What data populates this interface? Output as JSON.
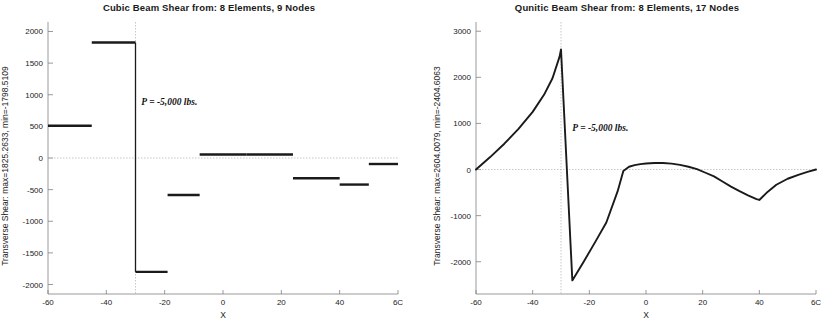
{
  "figure": {
    "background": "#ffffff",
    "line_color": "#1a1a1a",
    "axis_color": "#808080",
    "guide_color": "#b0b0b0"
  },
  "panels": [
    {
      "id": "cubic",
      "title": "Cubic Beam Shear from:  8 Elements, 9 Nodes",
      "ylabel": "Transverse Shear: max=1825.2633, min=-1798.5109",
      "xlabel": "X",
      "annotation": "P = -5,000 lbs.",
      "annotation_x": -28,
      "annotation_y": 870,
      "marker_x": -30,
      "xticklabels": [
        "-60",
        "-40",
        "-20",
        "0",
        "20",
        "40",
        "6C"
      ],
      "yticklabels": [
        "2000",
        "1500",
        "1000",
        "500",
        "0",
        "-500",
        "-1000",
        "-1500",
        "-2000"
      ]
    },
    {
      "id": "quintic",
      "title": "Qunitic Beam Shear from:  8 Elements, 17 Nodes",
      "ylabel": "Transverse Shear: max=2604.0079, min=-2404.6063",
      "xlabel": "X",
      "annotation": "P = -5,000 lbs.",
      "annotation_x": -26,
      "annotation_y": 880,
      "marker_x": -30,
      "xticklabels": [
        "-60",
        "-40",
        "-20",
        "0",
        "20",
        "40",
        "6C"
      ],
      "yticklabels": [
        "3000",
        "2000",
        "1000",
        "0",
        "-1000",
        "-2000"
      ]
    }
  ],
  "chart_data": [
    {
      "type": "line",
      "id": "cubic",
      "title": "Cubic Beam Shear from:  8 Elements, 9 Nodes",
      "xlabel": "X",
      "ylabel": "Transverse Shear: max=1825.2633, min=-1798.5109",
      "subtitle": "Cubic beam element transverse shear - piecewise constant per element",
      "xlim": [
        -60,
        60
      ],
      "ylim": [
        -2150,
        2150
      ],
      "xticks": [
        -60,
        -40,
        -20,
        0,
        20,
        40,
        60
      ],
      "yticks": [
        2000,
        1500,
        1000,
        500,
        0,
        -500,
        -1000,
        -1500,
        -2000
      ],
      "grid": false,
      "legend": "none",
      "max": 1825.2633,
      "min": -1798.5109,
      "annotations": [
        {
          "text": "P = -5,000 lbs.",
          "x": -28,
          "y": 870
        },
        {
          "text": "vertical marker line",
          "x": -30,
          "y": null
        }
      ],
      "series": [
        {
          "name": "Transverse Shear (piecewise constant)",
          "style": "step",
          "segments": [
            {
              "x_start": -60,
              "x_end": -45,
              "value": 510
            },
            {
              "x_start": -45,
              "x_end": -30,
              "value": 1825
            },
            {
              "x_start": -30,
              "x_end": -19,
              "value": -1800
            },
            {
              "x_start": -19,
              "x_end": -8,
              "value": -585
            },
            {
              "x_start": -8,
              "x_end": 8,
              "value": 55
            },
            {
              "x_start": 8,
              "x_end": 24,
              "value": 55
            },
            {
              "x_start": 24,
              "x_end": 40,
              "value": -320
            },
            {
              "x_start": 40,
              "x_end": 50,
              "value": -420
            },
            {
              "x_start": 50,
              "x_end": 60,
              "value": -95
            }
          ]
        }
      ]
    },
    {
      "type": "line",
      "id": "quintic",
      "title": "Qunitic Beam Shear from:  8 Elements, 17 Nodes",
      "xlabel": "X",
      "ylabel": "Transverse Shear: max=2604.0079, min=-2404.6063",
      "subtitle": "Quintic beam element transverse shear - continuous piecewise curve",
      "xlim": [
        -60,
        60
      ],
      "ylim": [
        -2700,
        3200
      ],
      "xticks": [
        -60,
        -40,
        -20,
        0,
        20,
        40,
        60
      ],
      "yticks": [
        3000,
        2000,
        1000,
        0,
        -1000,
        -2000
      ],
      "grid": false,
      "legend": "none",
      "max": 2604.0079,
      "min": -2404.6063,
      "annotations": [
        {
          "text": "P = -5,000 lbs.",
          "x": -26,
          "y": 880
        },
        {
          "text": "vertical marker line",
          "x": -30,
          "y": null
        }
      ],
      "series": [
        {
          "name": "Transverse Shear (continuous)",
          "style": "line",
          "x": [
            -60,
            -55,
            -50,
            -45,
            -40,
            -36,
            -33,
            -30.5,
            -30,
            -26,
            -22,
            -18,
            -14,
            -10,
            -8,
            -6,
            -4,
            -2,
            0,
            3,
            6,
            9,
            12,
            15,
            18,
            21,
            24,
            27,
            30,
            33,
            36,
            39,
            40,
            43,
            46,
            50,
            54,
            57,
            60
          ],
          "y": [
            0,
            270,
            560,
            880,
            1250,
            1620,
            1980,
            2450,
            2604,
            -2405,
            -2000,
            -1580,
            -1150,
            -470,
            -30,
            60,
            95,
            118,
            130,
            140,
            142,
            128,
            100,
            60,
            10,
            -70,
            -150,
            -260,
            -370,
            -470,
            -560,
            -640,
            -660,
            -480,
            -330,
            -200,
            -110,
            -50,
            0
          ]
        }
      ]
    }
  ]
}
